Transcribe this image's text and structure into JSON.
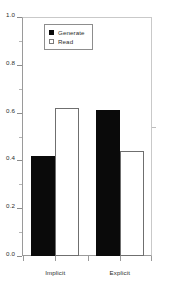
{
  "chart_data": {
    "type": "bar",
    "title": "",
    "subtitle": "",
    "xlabel": "",
    "ylabel": "",
    "categories": [
      "Implicit",
      "Explicit"
    ],
    "series": [
      {
        "name": "Generate",
        "values": [
          0.42,
          0.61
        ],
        "fill": "#000000",
        "style": "filled"
      },
      {
        "name": "Read",
        "values": [
          0.62,
          0.44
        ],
        "fill": "#ffffff",
        "style": "open"
      }
    ],
    "ylim": [
      0.0,
      1.0
    ],
    "ytick_labels": [
      "0.0",
      "0.2",
      "0.4",
      "0.6",
      "0.8",
      "1.0"
    ],
    "ytick_values": [
      0.0,
      0.2,
      0.4,
      0.6,
      0.8,
      1.0
    ],
    "yminor_values": [
      0.1,
      0.3,
      0.5,
      0.7,
      0.9
    ],
    "grid": false,
    "legend_position": "upper-left-inside",
    "legend_entries": [
      "Generate",
      "Read"
    ],
    "annotations": []
  },
  "axes": {
    "y_ticks": [
      {
        "label": "1.0",
        "value": 1.0
      },
      {
        "label": "0.8",
        "value": 0.8
      },
      {
        "label": "0.6",
        "value": 0.6
      },
      {
        "label": "0.4",
        "value": 0.4
      },
      {
        "label": "0.2",
        "value": 0.2
      },
      {
        "label": "0.0",
        "value": 0.0
      }
    ],
    "x_ticks": [
      {
        "label": "Implicit"
      },
      {
        "label": "Explicit"
      }
    ]
  },
  "legend": {
    "items": [
      {
        "label": "Generate",
        "marker": "filled-square-icon"
      },
      {
        "label": "Read",
        "marker": "open-square-icon"
      }
    ]
  }
}
